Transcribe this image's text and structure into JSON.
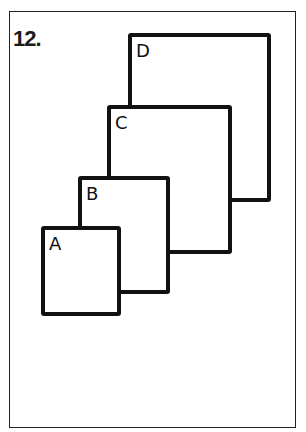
{
  "figure": {
    "number": "12.",
    "squares": [
      {
        "label": "D",
        "x": 130,
        "y": 35,
        "w": 139,
        "h": 165
      },
      {
        "label": "C",
        "x": 109,
        "y": 107,
        "w": 121,
        "h": 145
      },
      {
        "label": "B",
        "x": 80,
        "y": 178,
        "w": 88,
        "h": 114
      },
      {
        "label": "A",
        "x": 43,
        "y": 228,
        "w": 76,
        "h": 86
      }
    ],
    "colors": {
      "stroke": "#111111",
      "background": "#ffffff"
    }
  }
}
